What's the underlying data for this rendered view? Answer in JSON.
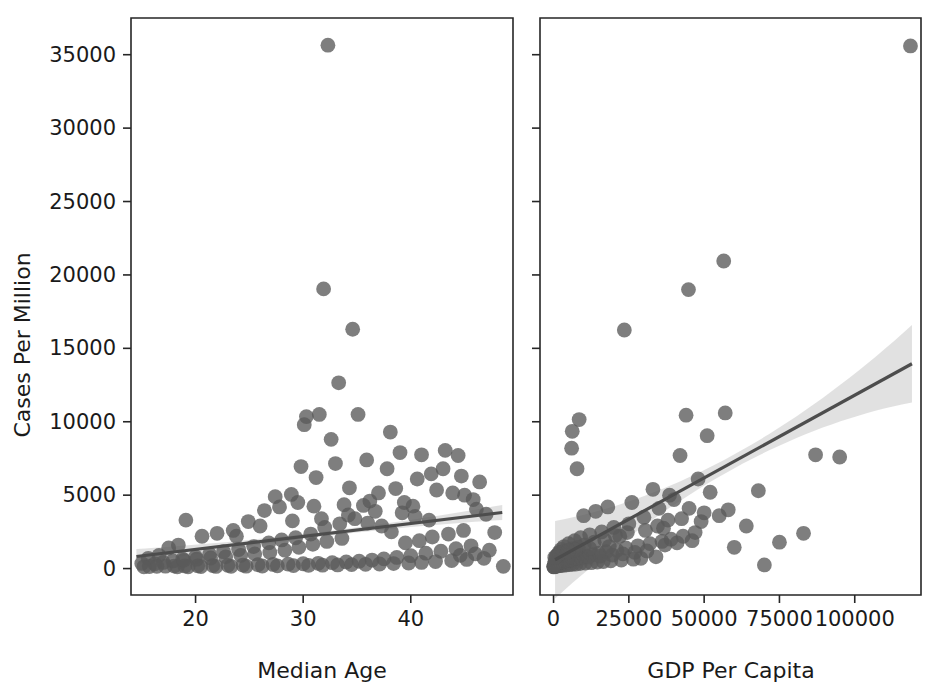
{
  "figure": {
    "type": "scatter-grid",
    "background": "#ffffff",
    "point_color": "#5a5a5a",
    "line_color": "#4d4d4d",
    "band_color": "#bdbdbd",
    "shared_ylabel": "Cases Per Million"
  },
  "chart_data": [
    {
      "type": "scatter",
      "panel": "left",
      "title": "",
      "xlabel": "Median Age",
      "ylabel": "Cases Per Million",
      "xlim": [
        14.0,
        49.5
      ],
      "ylim": [
        -1800,
        37500
      ],
      "xticks": [
        20,
        30,
        40
      ],
      "yticks": [
        0,
        5000,
        10000,
        15000,
        20000,
        25000,
        30000,
        35000
      ],
      "grid": false,
      "legend": "none",
      "regression": {
        "shown": true,
        "x_start": 14.5,
        "y_start": 820,
        "x_end": 48.5,
        "y_end": 3820,
        "confidence_band": true
      },
      "points": [
        [
          32.3,
          35650
        ],
        [
          31.9,
          19050
        ],
        [
          34.6,
          16300
        ],
        [
          33.3,
          12650
        ],
        [
          31.5,
          10500
        ],
        [
          30.3,
          10350
        ],
        [
          30.1,
          9800
        ],
        [
          35.1,
          10500
        ],
        [
          38.1,
          9300
        ],
        [
          43.2,
          8050
        ],
        [
          44.4,
          7700
        ],
        [
          41.0,
          7750
        ],
        [
          41.9,
          6450
        ],
        [
          40.6,
          6100
        ],
        [
          34.3,
          5500
        ],
        [
          33.0,
          7150
        ],
        [
          42.4,
          5350
        ],
        [
          43.9,
          5150
        ],
        [
          45.0,
          5000
        ],
        [
          38.6,
          5450
        ],
        [
          37.0,
          5150
        ],
        [
          36.2,
          4600
        ],
        [
          39.4,
          4500
        ],
        [
          40.2,
          4250
        ],
        [
          35.6,
          4300
        ],
        [
          33.8,
          4350
        ],
        [
          31.0,
          4250
        ],
        [
          29.5,
          4500
        ],
        [
          27.8,
          4200
        ],
        [
          26.4,
          3950
        ],
        [
          24.9,
          3200
        ],
        [
          23.5,
          2600
        ],
        [
          22.0,
          2400
        ],
        [
          20.6,
          2200
        ],
        [
          19.1,
          3300
        ],
        [
          18.4,
          1600
        ],
        [
          17.5,
          1400
        ],
        [
          16.6,
          900
        ],
        [
          15.6,
          700
        ],
        [
          15.0,
          350
        ],
        [
          46.1,
          4050
        ],
        [
          47.0,
          3700
        ],
        [
          47.8,
          2450
        ],
        [
          48.6,
          150
        ],
        [
          44.9,
          2600
        ],
        [
          43.5,
          2350
        ],
        [
          42.0,
          2150
        ],
        [
          40.8,
          1900
        ],
        [
          39.5,
          1750
        ],
        [
          38.2,
          2500
        ],
        [
          37.3,
          2900
        ],
        [
          36.0,
          3100
        ],
        [
          34.8,
          3400
        ],
        [
          33.4,
          3050
        ],
        [
          32.0,
          2800
        ],
        [
          30.7,
          2350
        ],
        [
          29.3,
          2100
        ],
        [
          28.0,
          1950
        ],
        [
          26.8,
          1750
        ],
        [
          25.4,
          1500
        ],
        [
          24.0,
          1300
        ],
        [
          22.6,
          1150
        ],
        [
          21.3,
          980
        ],
        [
          20.0,
          800
        ],
        [
          18.8,
          650
        ],
        [
          17.9,
          520
        ],
        [
          17.0,
          420
        ],
        [
          16.2,
          320
        ],
        [
          45.6,
          1550
        ],
        [
          44.2,
          1350
        ],
        [
          42.8,
          1180
        ],
        [
          41.4,
          1050
        ],
        [
          40.0,
          880
        ],
        [
          38.7,
          760
        ],
        [
          37.5,
          660
        ],
        [
          36.4,
          580
        ],
        [
          35.2,
          500
        ],
        [
          34.0,
          450
        ],
        [
          32.7,
          400
        ],
        [
          31.4,
          360
        ],
        [
          30.0,
          330
        ],
        [
          28.6,
          300
        ],
        [
          27.2,
          280
        ],
        [
          25.8,
          260
        ],
        [
          24.4,
          240
        ],
        [
          23.0,
          220
        ],
        [
          21.6,
          200
        ],
        [
          20.2,
          190
        ],
        [
          19.0,
          180
        ],
        [
          18.0,
          170
        ],
        [
          17.2,
          160
        ],
        [
          16.4,
          150
        ],
        [
          15.7,
          140
        ],
        [
          15.2,
          120
        ],
        [
          46.8,
          700
        ],
        [
          45.2,
          620
        ],
        [
          43.8,
          540
        ],
        [
          42.3,
          480
        ],
        [
          41.0,
          420
        ],
        [
          39.8,
          380
        ],
        [
          38.4,
          340
        ],
        [
          37.1,
          310
        ],
        [
          35.8,
          290
        ],
        [
          34.5,
          270
        ],
        [
          33.2,
          250
        ],
        [
          31.8,
          230
        ],
        [
          30.5,
          215
        ],
        [
          29.1,
          200
        ],
        [
          27.6,
          185
        ],
        [
          26.2,
          175
        ],
        [
          24.7,
          165
        ],
        [
          23.3,
          155
        ],
        [
          21.9,
          145
        ],
        [
          20.5,
          135
        ],
        [
          19.3,
          125
        ],
        [
          18.3,
          115
        ],
        [
          29.8,
          6950
        ],
        [
          31.2,
          6200
        ],
        [
          28.9,
          5050
        ],
        [
          27.4,
          4900
        ],
        [
          32.6,
          8800
        ],
        [
          35.9,
          7400
        ],
        [
          37.8,
          6800
        ],
        [
          39.0,
          7900
        ],
        [
          43.0,
          6800
        ],
        [
          44.7,
          6300
        ],
        [
          46.4,
          5900
        ],
        [
          45.8,
          4700
        ],
        [
          33.6,
          2050
        ],
        [
          32.2,
          1850
        ],
        [
          30.9,
          1650
        ],
        [
          29.6,
          1450
        ],
        [
          28.3,
          1250
        ],
        [
          26.9,
          1100
        ],
        [
          25.5,
          1000
        ],
        [
          24.2,
          900
        ],
        [
          22.8,
          800
        ],
        [
          21.4,
          720
        ],
        [
          20.1,
          640
        ],
        [
          18.9,
          560
        ],
        [
          47.3,
          1250
        ],
        [
          46.0,
          1000
        ],
        [
          44.6,
          900
        ],
        [
          41.7,
          3300
        ],
        [
          40.4,
          3550
        ],
        [
          39.2,
          3800
        ],
        [
          36.7,
          3900
        ],
        [
          34.2,
          3650
        ],
        [
          31.7,
          3400
        ],
        [
          29.0,
          3250
        ],
        [
          26.0,
          2900
        ],
        [
          23.8,
          2200
        ]
      ]
    },
    {
      "type": "scatter",
      "panel": "right",
      "title": "",
      "xlabel": "GDP Per Capita",
      "ylabel": "",
      "xlim": [
        -4500,
        122000
      ],
      "ylim": [
        -1800,
        37500
      ],
      "xticks": [
        0,
        25000,
        50000,
        75000,
        100000
      ],
      "yticks": [
        0,
        5000,
        10000,
        15000,
        20000,
        25000,
        30000,
        35000
      ],
      "grid": false,
      "legend": "none",
      "regression": {
        "shown": true,
        "x_start": 500,
        "y_start": 600,
        "x_end": 119000,
        "y_end": 13950,
        "confidence_band": true
      },
      "points": [
        [
          118500,
          35600
        ],
        [
          56500,
          20950
        ],
        [
          44800,
          19000
        ],
        [
          23500,
          16250
        ],
        [
          57000,
          10600
        ],
        [
          44000,
          10450
        ],
        [
          8500,
          10150
        ],
        [
          6200,
          9350
        ],
        [
          51000,
          9050
        ],
        [
          6000,
          8200
        ],
        [
          7800,
          6800
        ],
        [
          42000,
          7700
        ],
        [
          87000,
          7750
        ],
        [
          95000,
          7600
        ],
        [
          68000,
          5300
        ],
        [
          33000,
          5400
        ],
        [
          38500,
          5000
        ],
        [
          26000,
          4500
        ],
        [
          18000,
          4200
        ],
        [
          14000,
          3900
        ],
        [
          10000,
          3600
        ],
        [
          55000,
          3600
        ],
        [
          49000,
          3200
        ],
        [
          40000,
          4700
        ],
        [
          35000,
          4100
        ],
        [
          30000,
          3500
        ],
        [
          25000,
          3050
        ],
        [
          20000,
          2800
        ],
        [
          16000,
          2500
        ],
        [
          12000,
          2300
        ],
        [
          9000,
          2100
        ],
        [
          7000,
          1900
        ],
        [
          5000,
          1700
        ],
        [
          3500,
          1500
        ],
        [
          2500,
          1300
        ],
        [
          1800,
          1100
        ],
        [
          1200,
          900
        ],
        [
          800,
          700
        ],
        [
          500,
          500
        ],
        [
          60000,
          1450
        ],
        [
          70000,
          250
        ],
        [
          47000,
          2450
        ],
        [
          43000,
          2200
        ],
        [
          39000,
          2000
        ],
        [
          36000,
          1850
        ],
        [
          32000,
          1700
        ],
        [
          28000,
          1550
        ],
        [
          24000,
          1400
        ],
        [
          21000,
          1250
        ],
        [
          17500,
          1150
        ],
        [
          15000,
          1050
        ],
        [
          13000,
          950
        ],
        [
          11000,
          860
        ],
        [
          9500,
          780
        ],
        [
          8000,
          700
        ],
        [
          6800,
          640
        ],
        [
          5600,
          580
        ],
        [
          4600,
          520
        ],
        [
          3800,
          470
        ],
        [
          3000,
          420
        ],
        [
          2400,
          380
        ],
        [
          1900,
          340
        ],
        [
          1400,
          300
        ],
        [
          1000,
          260
        ],
        [
          700,
          230
        ],
        [
          450,
          200
        ],
        [
          300,
          170
        ],
        [
          200,
          150
        ],
        [
          150,
          130
        ],
        [
          100,
          110
        ],
        [
          34000,
          800
        ],
        [
          29000,
          700
        ],
        [
          26500,
          640
        ],
        [
          22500,
          580
        ],
        [
          19000,
          530
        ],
        [
          16500,
          480
        ],
        [
          14500,
          440
        ],
        [
          12500,
          400
        ],
        [
          10500,
          370
        ],
        [
          8800,
          340
        ],
        [
          7400,
          310
        ],
        [
          6200,
          290
        ],
        [
          5200,
          270
        ],
        [
          4200,
          250
        ],
        [
          3400,
          230
        ],
        [
          2700,
          215
        ],
        [
          2100,
          200
        ],
        [
          1600,
          185
        ],
        [
          1100,
          175
        ],
        [
          600,
          165
        ],
        [
          350,
          155
        ],
        [
          180,
          145
        ],
        [
          120,
          135
        ],
        [
          46000,
          1900
        ],
        [
          41000,
          1750
        ],
        [
          37000,
          1600
        ],
        [
          31000,
          1200
        ],
        [
          27000,
          1100
        ],
        [
          23000,
          1000
        ],
        [
          19500,
          920
        ],
        [
          15500,
          850
        ],
        [
          11500,
          790
        ],
        [
          9200,
          730
        ],
        [
          7600,
          680
        ],
        [
          6400,
          630
        ],
        [
          5400,
          590
        ],
        [
          4400,
          550
        ],
        [
          3600,
          510
        ],
        [
          2900,
          480
        ],
        [
          2200,
          450
        ],
        [
          1700,
          420
        ],
        [
          1300,
          390
        ],
        [
          900,
          360
        ],
        [
          550,
          330
        ],
        [
          250,
          300
        ],
        [
          48000,
          6100
        ],
        [
          52000,
          5200
        ],
        [
          45000,
          4100
        ],
        [
          58000,
          4000
        ],
        [
          38000,
          3300
        ],
        [
          34500,
          2900
        ],
        [
          30500,
          2600
        ],
        [
          22000,
          2200
        ],
        [
          17000,
          1950
        ],
        [
          13500,
          1800
        ],
        [
          10200,
          1600
        ],
        [
          8200,
          1450
        ],
        [
          6600,
          1350
        ],
        [
          5000,
          1250
        ],
        [
          3200,
          1150
        ],
        [
          2000,
          1050
        ],
        [
          1500,
          950
        ],
        [
          900,
          850
        ],
        [
          400,
          750
        ],
        [
          64000,
          2900
        ],
        [
          75000,
          1800
        ],
        [
          83000,
          2400
        ],
        [
          50000,
          3800
        ],
        [
          42500,
          3400
        ],
        [
          36500,
          2750
        ],
        [
          24500,
          2450
        ],
        [
          20500,
          2250
        ],
        [
          18500,
          1500
        ],
        [
          12000,
          1380
        ],
        [
          7200,
          1280
        ],
        [
          4800,
          1180
        ]
      ]
    }
  ],
  "left_panel": {
    "name": "median-age-panel",
    "xlabel": "Median Age",
    "xtick_labels": [
      "20",
      "30",
      "40"
    ]
  },
  "right_panel": {
    "name": "gdp-per-capita-panel",
    "xlabel": "GDP Per Capita",
    "xtick_labels": [
      "0",
      "25000",
      "50000",
      "75000",
      "100000"
    ]
  },
  "yaxis": {
    "label": "Cases Per Million",
    "tick_labels": [
      "0",
      "5000",
      "10000",
      "15000",
      "20000",
      "25000",
      "30000",
      "35000"
    ]
  }
}
